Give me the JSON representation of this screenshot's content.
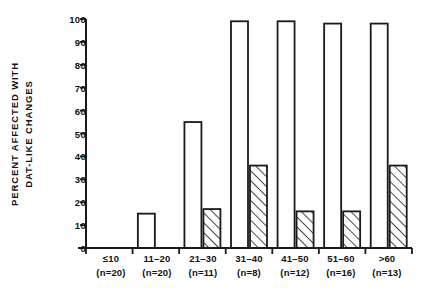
{
  "chart_data": {
    "type": "bar",
    "title": "",
    "subtitle": "",
    "xlabel": "",
    "ylabel": "PERCENT AFFECTED WITH DAT-LIKE CHANGES",
    "ylabel_lines": [
      "PERCENT AFFECTED WITH",
      "DAT-LIKE CHANGES"
    ],
    "ylim": [
      0,
      100
    ],
    "ytick_step": 10,
    "yticks": [
      0,
      10,
      20,
      30,
      40,
      50,
      60,
      70,
      80,
      90,
      100
    ],
    "ytick_labels": [
      "0",
      "10",
      "20",
      "30",
      "40",
      "50",
      "60",
      "70",
      "80",
      "90",
      "100"
    ],
    "grid": false,
    "legend": null,
    "legend_position": "none",
    "categories": [
      "≤10",
      "11–20",
      "21–30",
      "31–40",
      "41–50",
      "51–60",
      ">60"
    ],
    "category_sublabels": [
      "(n=20)",
      "(n=20)",
      "(n=11)",
      "(n=8)",
      "(n=12)",
      "(n=16)",
      "(n=13)"
    ],
    "sample_sizes": [
      20,
      20,
      11,
      8,
      12,
      16,
      13
    ],
    "series": [
      {
        "name": "open",
        "fill": "white",
        "values": [
          0,
          15,
          55,
          99,
          99,
          98,
          98
        ]
      },
      {
        "name": "hatched",
        "fill": "diagonal-hatch",
        "values": [
          0,
          0,
          17,
          36,
          16,
          16,
          36
        ]
      }
    ],
    "annotations": []
  },
  "axis": {
    "line_color": "#1a1a1a",
    "bar_edge_color": "#1a1a1a",
    "background": "#ffffff"
  }
}
